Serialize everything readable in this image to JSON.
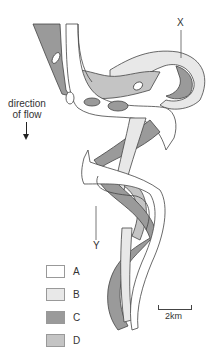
{
  "figure": {
    "labels": {
      "x_marker": "X",
      "y_marker": "Y",
      "direction": "direction of flow",
      "direction_line1": "direction",
      "direction_line2": "of flow"
    },
    "legend": [
      {
        "key": "A",
        "color": "#ffffff"
      },
      {
        "key": "B",
        "color": "#e8e8e8"
      },
      {
        "key": "C",
        "color": "#9a9a9a"
      },
      {
        "key": "D",
        "color": "#c4c4c4"
      }
    ],
    "scale_bar": {
      "label": "2km"
    },
    "colors": {
      "outline": "#444444",
      "A": "#ffffff",
      "B": "#e8e8e8",
      "C": "#9a9a9a",
      "D": "#c4c4c4"
    }
  }
}
